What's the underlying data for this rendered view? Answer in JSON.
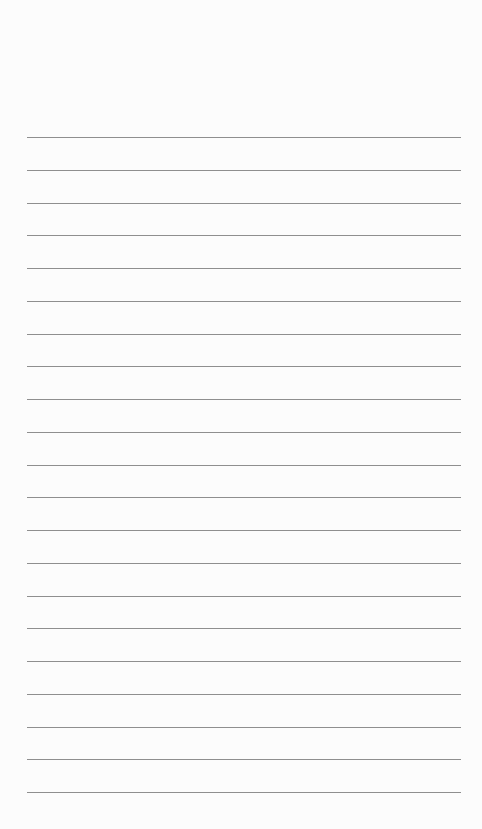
{
  "page": {
    "type": "blank-lined-paper",
    "background_color": "#fcfcfc",
    "rule_color": "#8f8f8f",
    "rule_count": 21,
    "rule_left": 27,
    "rule_width": 434,
    "first_rule_y": 137,
    "rule_spacing": 32.75
  }
}
